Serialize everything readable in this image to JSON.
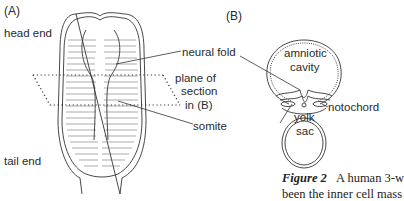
{
  "panel_a": {
    "label": "(A)",
    "labels": {
      "head_end": "head end",
      "tail_end": "tail end",
      "neural_fold": "neural fold",
      "plane_line1": "plane of",
      "plane_line2": "section",
      "plane_line3": "in (B)",
      "somite": "somite"
    }
  },
  "panel_b": {
    "label": "(B)",
    "labels": {
      "amniotic1": "amniotic",
      "amniotic2": "cavity",
      "notochord": "notochord",
      "yolk1": "yolk",
      "yolk2": "sac"
    }
  },
  "caption": {
    "figure": "Figure 2",
    "text_line1": "A human 3-w",
    "text_line2": "been the inner cell mass"
  },
  "colors": {
    "ink": "#2a2a2a",
    "background": "#ffffff"
  }
}
